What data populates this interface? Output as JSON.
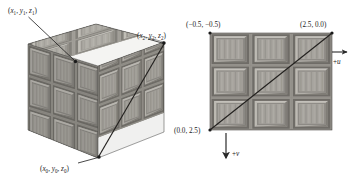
{
  "figure": {
    "name": "texture-mapping-cube-and-uv-square",
    "background": "#ffffff",
    "ink_color": "#1a1a1a",
    "texture_colors": {
      "panel_light": "#b9b6b0",
      "panel_mid": "#9d9a94",
      "panel_dark": "#7d7a75",
      "groove": "#6e6b66",
      "top_face": "#a9a6a0",
      "left_face": "#8e8b86",
      "right_face": "#9b9892"
    }
  },
  "cube": {
    "caption": "textured crate cube",
    "vertices": [
      {
        "id": "v1",
        "label": "(x₁, y₁, z₁)",
        "x": "x",
        "xs": "1",
        "y": "y",
        "ys": "1",
        "z": "z",
        "zs": "1"
      },
      {
        "id": "v2",
        "label": "(x₂, y₂, z₂)",
        "x": "x",
        "xs": "2",
        "y": "y",
        "ys": "2",
        "z": "z",
        "zs": "2"
      },
      {
        "id": "v0",
        "label": "(x₀, y₀, z₀)",
        "x": "x",
        "xs": "0",
        "y": "y",
        "ys": "0",
        "z": "z",
        "zs": "0"
      }
    ],
    "open_paren": "(",
    "close_paren": ")",
    "comma": ", ",
    "diagonal": "triangle hypotenuse drawn across the front-right face"
  },
  "uv_square": {
    "caption": "texture space unit square",
    "corners": [
      {
        "id": "uv-top-left",
        "label": "(−0.5, −0.5)",
        "u": "-0.5",
        "v": "-0.5"
      },
      {
        "id": "uv-top-right",
        "label": "(2.5, 0.0)",
        "u": "2.5",
        "v": "0.0"
      },
      {
        "id": "uv-bottom-left",
        "label": "(0.0, 2.5)",
        "u": "0.0",
        "v": "2.5"
      }
    ],
    "axes": [
      {
        "id": "u-axis",
        "label": "+u",
        "direction": "right"
      },
      {
        "id": "v-axis",
        "label": "+v",
        "direction": "down"
      }
    ],
    "grid": {
      "cols": 3,
      "rows": 3
    },
    "diagonal": "line from bottom-left corner to top-right corner"
  }
}
